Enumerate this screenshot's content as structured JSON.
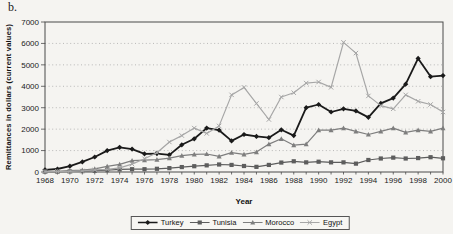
{
  "panel_label": "b.",
  "colors": {
    "background": "#f5f4f1",
    "plot_border": "#4a4a4a",
    "gridline": "#a9a9a9",
    "text": "#1a1a1a",
    "turkey": "#1a1a1a",
    "tunisia": "#5d5d5d",
    "morocco": "#7e7e7e",
    "egypt": "#a6a6a6"
  },
  "chart_data": {
    "type": "line",
    "title": "",
    "xlabel": "Year",
    "ylabel": "Remittances in dollars (current values)",
    "x": [
      1968,
      1969,
      1970,
      1971,
      1972,
      1973,
      1974,
      1975,
      1976,
      1977,
      1978,
      1979,
      1980,
      1981,
      1982,
      1983,
      1984,
      1985,
      1986,
      1987,
      1988,
      1989,
      1990,
      1991,
      1992,
      1993,
      1994,
      1995,
      1996,
      1997,
      1998,
      1999,
      2000
    ],
    "x_tick_labels": [
      1968,
      1970,
      1972,
      1974,
      1976,
      1978,
      1980,
      1982,
      1984,
      1986,
      1988,
      1990,
      1992,
      1994,
      1996,
      1998,
      2000
    ],
    "ylim": [
      0,
      7000
    ],
    "y_ticks": [
      0,
      1000,
      2000,
      3000,
      4000,
      5000,
      6000,
      7000
    ],
    "grid": "horizontal-dashed",
    "legend_position": "bottom-center-boxed",
    "series": [
      {
        "name": "Turkey",
        "marker": "diamond",
        "color": "#1a1a1a",
        "values": [
          100,
          140,
          270,
          470,
          700,
          1000,
          1150,
          1070,
          850,
          860,
          800,
          1270,
          1550,
          2050,
          1950,
          1450,
          1750,
          1660,
          1600,
          1970,
          1700,
          3000,
          3150,
          2800,
          2950,
          2850,
          2550,
          3200,
          3450,
          4100,
          5300,
          4450,
          4500
        ]
      },
      {
        "name": "Tunisia",
        "marker": "square",
        "color": "#5d5d5d",
        "values": [
          15,
          20,
          30,
          40,
          60,
          90,
          120,
          130,
          130,
          150,
          180,
          230,
          270,
          310,
          350,
          330,
          280,
          240,
          330,
          440,
          500,
          450,
          480,
          450,
          450,
          390,
          560,
          630,
          670,
          630,
          650,
          690,
          640
        ]
      },
      {
        "name": "Morocco",
        "marker": "triangle",
        "color": "#7e7e7e",
        "values": [
          25,
          35,
          65,
          90,
          150,
          260,
          360,
          530,
          550,
          580,
          650,
          760,
          820,
          840,
          730,
          900,
          820,
          930,
          1300,
          1550,
          1250,
          1300,
          1950,
          1950,
          2050,
          1900,
          1750,
          1900,
          2050,
          1850,
          1950,
          1900,
          2050
        ]
      },
      {
        "name": "Egypt",
        "marker": "x",
        "color": "#a6a6a6",
        "values": [
          20,
          25,
          30,
          50,
          100,
          120,
          190,
          370,
          620,
          900,
          1400,
          1700,
          2050,
          1800,
          2150,
          3600,
          3950,
          3200,
          2450,
          3500,
          3700,
          4150,
          4200,
          3950,
          6050,
          5550,
          3550,
          3100,
          2950,
          3600,
          3300,
          3150,
          2800
        ]
      }
    ]
  }
}
